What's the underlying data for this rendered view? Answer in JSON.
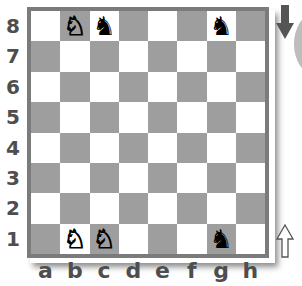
{
  "board": {
    "ranks": [
      "8",
      "7",
      "6",
      "5",
      "4",
      "3",
      "2",
      "1"
    ],
    "files": [
      "a",
      "b",
      "c",
      "d",
      "e",
      "f",
      "g",
      "h"
    ],
    "colors": {
      "light": "#ffffff",
      "dark": "#9e9e9e",
      "border": "#7b7b7b",
      "labels": "#4e4e4e"
    },
    "pieces": [
      {
        "square": "b8",
        "type": "knight",
        "color": "white",
        "glyph": "♘"
      },
      {
        "square": "c8",
        "type": "knight",
        "color": "black",
        "glyph": "♞"
      },
      {
        "square": "g8",
        "type": "knight",
        "color": "black",
        "glyph": "♞"
      },
      {
        "square": "b1",
        "type": "knight",
        "color": "white",
        "glyph": "♘"
      },
      {
        "square": "c1",
        "type": "knight",
        "color": "white",
        "glyph": "♘"
      },
      {
        "square": "g1",
        "type": "knight",
        "color": "black",
        "glyph": "♞"
      }
    ]
  },
  "indicators": {
    "top_arrow": {
      "direction": "down",
      "icon": "arrow-down-icon",
      "fill": "#555555"
    },
    "bottom_arrow": {
      "direction": "up",
      "icon": "arrow-up-icon",
      "fill": "#ffffff"
    }
  }
}
